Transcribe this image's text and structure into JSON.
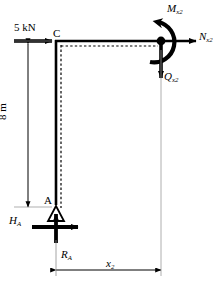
{
  "figure": {
    "type": "statics-free-body-diagram",
    "colors": {
      "structure": "#000000",
      "background": "#ffffff",
      "extension_line": "#9a9a9a",
      "caption": "#6f6f6f"
    }
  },
  "loads": {
    "applied": {
      "label": "5 kN",
      "direction": "right",
      "at_point": "C"
    },
    "reaction_horizontal": {
      "symbol": "H",
      "subscript": "A"
    },
    "reaction_vertical": {
      "symbol": "R",
      "subscript": "A"
    }
  },
  "points": {
    "top_joint": "C",
    "support": "A"
  },
  "internal_forces": {
    "moment": {
      "symbol": "M",
      "subscript": "x2",
      "sense": "counterclockwise"
    },
    "normal": {
      "symbol": "N",
      "subscript": "x2",
      "direction": "right"
    },
    "shear": {
      "symbol": "Q",
      "subscript": "x2",
      "direction": "down"
    }
  },
  "dimensions": {
    "height": {
      "label": "8 m",
      "orientation": "vertical"
    },
    "length": {
      "symbol": "x",
      "subscript": "2",
      "orientation": "horizontal"
    }
  },
  "caption": {
    "text": ""
  }
}
